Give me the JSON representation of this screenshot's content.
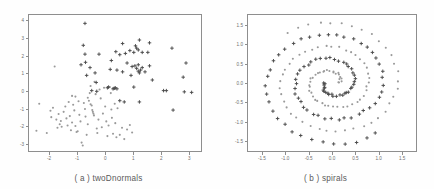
{
  "figure": {
    "background": "#fefefe",
    "frame_color": "#8e8e8e",
    "tick_color": "#6d6d6d",
    "caption_color": "#5a5a5a"
  },
  "panels": [
    {
      "id": "panel-a",
      "caption": "( a ) twoDnormals"
    },
    {
      "id": "panel-b",
      "caption": "( b ) spirals"
    }
  ],
  "chart_data": [
    {
      "type": "scatter",
      "title": "( a ) twoDnormals",
      "xlabel": "",
      "ylabel": "",
      "grid": false,
      "legend": "none",
      "xlim": [
        -2.75,
        3.45
      ],
      "ylim": [
        -3.45,
        4.35
      ],
      "xticks": [
        "-2",
        "-1",
        "0",
        "1",
        "2",
        "3"
      ],
      "xtick_values": [
        -2,
        -1,
        0,
        1,
        2,
        3
      ],
      "yticks": [
        "4",
        "3",
        "2",
        "1",
        "0",
        "-1",
        "-2",
        "-3"
      ],
      "ytick_values": [
        4,
        3,
        2,
        1,
        0,
        -1,
        -2,
        -3
      ],
      "series": [
        {
          "name": "class-1-dots",
          "marker": "dot",
          "color": "#9a9a9a",
          "points": [
            [
              -2.45,
              -2.25
            ],
            [
              -2.35,
              -0.72
            ],
            [
              -2.08,
              -2.38
            ],
            [
              -1.95,
              -1.12
            ],
            [
              -1.92,
              -1.48
            ],
            [
              -1.86,
              -0.95
            ],
            [
              -1.8,
              1.38
            ],
            [
              -1.74,
              -1.62
            ],
            [
              -1.7,
              -2.08
            ],
            [
              -1.66,
              -1.3
            ],
            [
              -1.62,
              -1.88
            ],
            [
              -1.58,
              -1.7
            ],
            [
              -1.55,
              -2.02
            ],
            [
              -1.48,
              -1.18
            ],
            [
              -1.42,
              -0.88
            ],
            [
              -1.38,
              -1.55
            ],
            [
              -1.34,
              -1.95
            ],
            [
              -1.3,
              -0.62
            ],
            [
              -1.26,
              -1.42
            ],
            [
              -1.22,
              -2.22
            ],
            [
              -1.18,
              -1.78
            ],
            [
              -1.14,
              -0.78
            ],
            [
              -1.1,
              -1.1
            ],
            [
              -1.06,
              -1.98
            ],
            [
              -1.02,
              -2.32
            ],
            [
              -0.98,
              -2.28
            ],
            [
              -0.95,
              -0.58
            ],
            [
              -0.92,
              -1.35
            ],
            [
              -0.88,
              -1.72
            ],
            [
              -0.84,
              -2.92
            ],
            [
              -0.8,
              -3.08
            ],
            [
              -0.76,
              -0.68
            ],
            [
              -0.72,
              -1.02
            ],
            [
              -0.7,
              -1.45
            ],
            [
              -0.66,
              -2.48
            ],
            [
              -0.62,
              -1.88
            ],
            [
              -0.58,
              -0.55
            ],
            [
              -0.55,
              -0.12
            ],
            [
              -0.52,
              0.28
            ],
            [
              -0.48,
              -0.82
            ],
            [
              -0.46,
              -1.08
            ],
            [
              -0.44,
              -1.18
            ],
            [
              -0.42,
              -1.28
            ],
            [
              -0.4,
              -1.38
            ],
            [
              -0.38,
              0.52
            ],
            [
              -0.34,
              -0.18
            ],
            [
              -0.3,
              -2.12
            ],
            [
              -0.28,
              -2.38
            ],
            [
              -0.24,
              -1.62
            ],
            [
              -0.2,
              0.08
            ],
            [
              -0.16,
              -0.42
            ],
            [
              -0.12,
              -2.05
            ],
            [
              -0.08,
              -1.28
            ],
            [
              -0.04,
              0.18
            ],
            [
              0.0,
              -0.88
            ],
            [
              0.04,
              -1.72
            ],
            [
              0.08,
              -2.55
            ],
            [
              0.12,
              -1.95
            ],
            [
              0.16,
              0.22
            ],
            [
              0.2,
              -0.12
            ],
            [
              0.24,
              -1.52
            ],
            [
              0.28,
              -2.42
            ],
            [
              0.32,
              0.12
            ],
            [
              0.36,
              -1.82
            ],
            [
              0.4,
              -2.62
            ],
            [
              0.44,
              -0.98
            ],
            [
              0.52,
              -2.48
            ],
            [
              0.6,
              -2.08
            ],
            [
              0.68,
              -2.72
            ],
            [
              0.78,
              -2.18
            ],
            [
              0.88,
              -1.92
            ],
            [
              0.96,
              -2.35
            ],
            [
              -1.18,
              -0.28
            ],
            [
              -1.06,
              -0.32
            ],
            [
              -0.62,
              -0.38
            ],
            [
              -0.52,
              -0.75
            ],
            [
              0.22,
              -1.05
            ],
            [
              0.34,
              -0.72
            ]
          ]
        },
        {
          "name": "class-2-crosses",
          "marker": "plus",
          "color": "#4a4a4a",
          "points": [
            [
              -0.72,
              3.82
            ],
            [
              1.22,
              2.88
            ],
            [
              1.58,
              2.72
            ],
            [
              0.62,
              2.68
            ],
            [
              1.08,
              2.55
            ],
            [
              -0.78,
              2.58
            ],
            [
              1.12,
              2.42
            ],
            [
              1.18,
              2.32
            ],
            [
              0.38,
              2.22
            ],
            [
              0.72,
              2.12
            ],
            [
              1.02,
              2.18
            ],
            [
              1.32,
              2.18
            ],
            [
              1.52,
              2.18
            ],
            [
              -0.72,
              2.08
            ],
            [
              -0.22,
              2.08
            ],
            [
              0.52,
              2.05
            ],
            [
              0.88,
              2.28
            ],
            [
              2.38,
              2.42
            ],
            [
              -0.7,
              1.62
            ],
            [
              0.22,
              1.72
            ],
            [
              0.78,
              1.58
            ],
            [
              1.18,
              1.48
            ],
            [
              1.58,
              1.42
            ],
            [
              2.88,
              1.58
            ],
            [
              -0.54,
              1.32
            ],
            [
              0.18,
              1.22
            ],
            [
              0.42,
              1.18
            ],
            [
              0.62,
              1.08
            ],
            [
              1.12,
              1.28
            ],
            [
              1.18,
              1.12
            ],
            [
              1.22,
              1.02
            ],
            [
              1.26,
              1.18
            ],
            [
              1.32,
              1.32
            ],
            [
              1.42,
              1.08
            ],
            [
              2.78,
              0.78
            ],
            [
              -0.36,
              1.02
            ],
            [
              0.92,
              0.88
            ],
            [
              -0.32,
              0.48
            ],
            [
              0.08,
              0.18
            ],
            [
              0.12,
              0.22
            ],
            [
              0.28,
              0.12
            ],
            [
              0.32,
              0.15
            ],
            [
              0.36,
              0.18
            ],
            [
              0.42,
              0.12
            ],
            [
              1.02,
              0.22
            ],
            [
              1.68,
              0.62
            ],
            [
              2.08,
              0.02
            ],
            [
              2.18,
              0.02
            ],
            [
              2.82,
              -0.05
            ],
            [
              3.08,
              -0.08
            ],
            [
              -0.48,
              0.02
            ],
            [
              -0.3,
              -0.02
            ],
            [
              0.68,
              -0.62
            ],
            [
              1.22,
              -0.62
            ],
            [
              2.42,
              -1.08
            ],
            [
              0.52,
              -0.55
            ],
            [
              -0.86,
              1.48
            ],
            [
              -0.66,
              0.88
            ],
            [
              0.96,
              1.38
            ],
            [
              1.06,
              1.42
            ]
          ]
        }
      ]
    },
    {
      "type": "scatter",
      "title": "( b ) spirals",
      "xlabel": "",
      "ylabel": "",
      "grid": false,
      "legend": "none",
      "xlim": [
        -1.82,
        1.82
      ],
      "ylim": [
        -1.78,
        1.78
      ],
      "xticks": [
        "-1.5",
        "-1.0",
        "-0.5",
        "0.0",
        "0.5",
        "1.0",
        "1.5"
      ],
      "xtick_values": [
        -1.5,
        -1.0,
        -0.5,
        0.0,
        0.5,
        1.0,
        1.5
      ],
      "yticks": [
        "1.5",
        "1.0",
        "0.5",
        "0.0",
        "-0.5",
        "-1.0",
        "-1.5"
      ],
      "ytick_values": [
        1.5,
        1.0,
        0.5,
        0.0,
        -0.5,
        -1.0,
        -1.5
      ],
      "spiral_params": {
        "n_points_per_arm": 97,
        "turns": 2.35,
        "arm_offset_radians": 3.14159,
        "r_start": 0.16,
        "r_end": 1.62,
        "noise": 0.025
      },
      "series": [
        {
          "name": "class-1-dots",
          "marker": "dot",
          "color": "#9a9a9a",
          "phase": 0.0
        },
        {
          "name": "class-2-crosses",
          "marker": "plus",
          "color": "#4a4a4a",
          "phase": 3.14159
        }
      ]
    }
  ]
}
